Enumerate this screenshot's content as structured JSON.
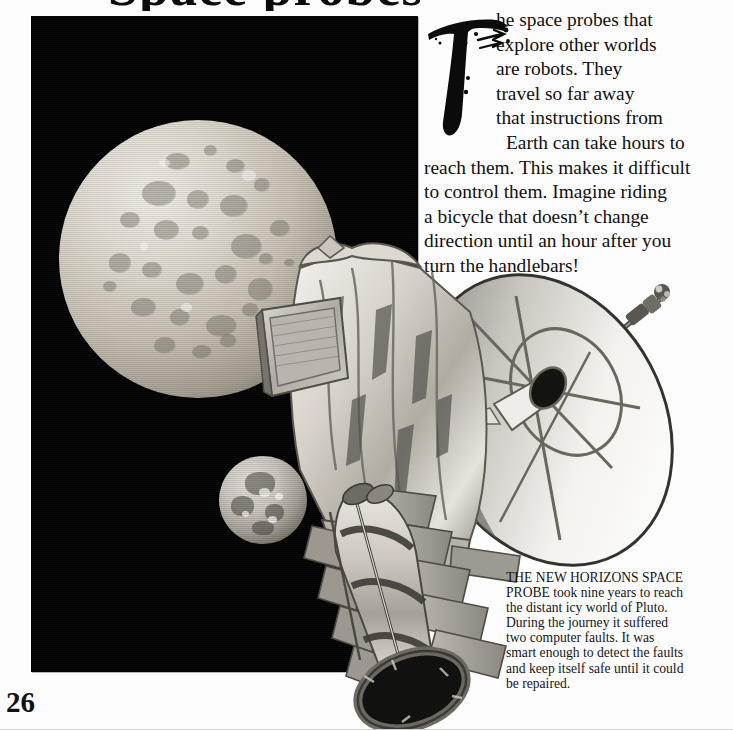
{
  "page": {
    "folio": "26",
    "title_remnant": "Space probes",
    "background_color": "#fdfdfd",
    "plate_color": "#000000"
  },
  "illustration": {
    "name": "new-horizons-at-pluto",
    "objects": [
      {
        "name": "pluto",
        "label": "Pluto"
      },
      {
        "name": "charon",
        "label": "Charon"
      },
      {
        "name": "spacecraft",
        "label": "New Horizons space probe"
      },
      {
        "name": "high-gain-antenna-dish",
        "label": "High-gain antenna dish"
      },
      {
        "name": "rtg-generator",
        "label": "Radioisotope thermoelectric generator"
      },
      {
        "name": "instrument-boom",
        "label": "Instrument boom"
      }
    ]
  },
  "body": {
    "dropcap": "T",
    "lines": [
      "he space probes that",
      "explore other worlds",
      "are robots. They",
      "travel so far away",
      "that instructions from",
      "Earth can take hours to",
      "reach them. This makes it difficult",
      "to control them. Imagine riding",
      "a bicycle that doesn’t change",
      "direction until an hour after you",
      "turn the handlebars!"
    ]
  },
  "caption": {
    "lines": [
      "THE NEW HORIZONS SPACE",
      "PROBE took nine years to reach",
      "the distant icy world of Pluto.",
      "During the journey it suffered",
      "two computer faults. It was",
      "smart enough to detect the faults",
      "and keep itself safe until it could",
      "be repaired."
    ]
  }
}
